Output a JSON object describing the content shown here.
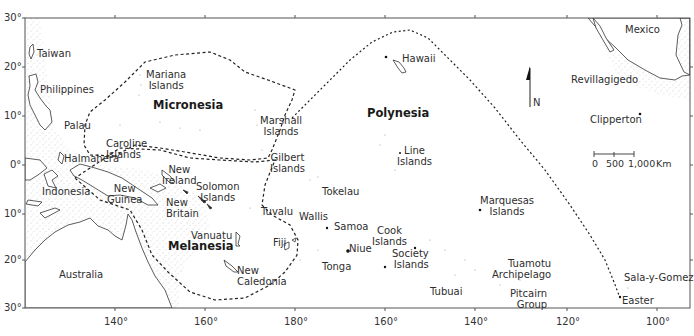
{
  "map": {
    "title": "Pacific Islands: Micronesia, Melanesia, Polynesia",
    "regions": [
      {
        "name": "Micronesia",
        "x": 153,
        "y": 98
      },
      {
        "name": "Polynesia",
        "x": 367,
        "y": 106
      },
      {
        "name": "Melanesia",
        "x": 168,
        "y": 240
      }
    ],
    "labels": [
      {
        "id": "mexico",
        "text": "Mexico",
        "x": 625,
        "y": 24
      },
      {
        "id": "taiwan",
        "text": "Taiwan",
        "x": 37,
        "y": 48
      },
      {
        "id": "hawaii",
        "text": "Hawaii",
        "x": 402,
        "y": 53
      },
      {
        "id": "philippines",
        "text": "Philippines",
        "x": 40,
        "y": 84
      },
      {
        "id": "revillagigedo",
        "text": "Revillagigedo",
        "x": 571,
        "y": 74
      },
      {
        "id": "mariana",
        "text": "Mariana\nIslands",
        "x": 146,
        "y": 69
      },
      {
        "id": "palau",
        "text": "Palau",
        "x": 64,
        "y": 120
      },
      {
        "id": "marshall",
        "text": "Marshall\nIslands",
        "x": 260,
        "y": 115
      },
      {
        "id": "clipperton",
        "text": "Clipperton",
        "x": 590,
        "y": 114
      },
      {
        "id": "caroline",
        "text": "Caroline\nIslands",
        "x": 106,
        "y": 138
      },
      {
        "id": "line",
        "text": "Line\nIslands",
        "x": 397,
        "y": 145
      },
      {
        "id": "gilbert",
        "text": "Gilbert\nIslands",
        "x": 270,
        "y": 152
      },
      {
        "id": "halmahera",
        "text": "Halmahera",
        "x": 64,
        "y": 153
      },
      {
        "id": "new-ireland",
        "text": "New\nIreland",
        "x": 162,
        "y": 164
      },
      {
        "id": "indonesia",
        "text": "Indonesia",
        "x": 42,
        "y": 186
      },
      {
        "id": "new-guinea",
        "text": "New\nGuinea",
        "x": 107,
        "y": 183
      },
      {
        "id": "solomon",
        "text": "Solomon\nIslands",
        "x": 196,
        "y": 181
      },
      {
        "id": "tokelau",
        "text": "Tokelau",
        "x": 322,
        "y": 186
      },
      {
        "id": "marquesas",
        "text": "Marquesas\nIslands",
        "x": 480,
        "y": 195
      },
      {
        "id": "new-britain",
        "text": "New\nBritain",
        "x": 166,
        "y": 197
      },
      {
        "id": "tuvalu",
        "text": "Tuvalu",
        "x": 261,
        "y": 206
      },
      {
        "id": "wallis",
        "text": "Wallis",
        "x": 299,
        "y": 211
      },
      {
        "id": "samoa",
        "text": "Samoa",
        "x": 334,
        "y": 221
      },
      {
        "id": "vanuatu",
        "text": "Vanuatu",
        "x": 191,
        "y": 230
      },
      {
        "id": "cook",
        "text": "Cook\nIslands",
        "x": 372,
        "y": 225
      },
      {
        "id": "fiji",
        "text": "Fiji",
        "x": 273,
        "y": 237
      },
      {
        "id": "niue",
        "text": "Niue",
        "x": 349,
        "y": 243
      },
      {
        "id": "society",
        "text": "Society\nIslands",
        "x": 392,
        "y": 248
      },
      {
        "id": "tonga",
        "text": "Tonga",
        "x": 322,
        "y": 261
      },
      {
        "id": "new-caledonia",
        "text": "New\nCaledonia",
        "x": 237,
        "y": 265
      },
      {
        "id": "tuamotu",
        "text": "Tuamotu\nArchipelago",
        "x": 492,
        "y": 258
      },
      {
        "id": "australia",
        "text": "Australia",
        "x": 59,
        "y": 269
      },
      {
        "id": "sala-y-gomez",
        "text": "Sala-y-Gomez",
        "x": 624,
        "y": 272
      },
      {
        "id": "tubuai",
        "text": "Tubuai",
        "x": 430,
        "y": 286
      },
      {
        "id": "pitcairn",
        "text": "Pitcairn\nGroup",
        "x": 510,
        "y": 288
      },
      {
        "id": "easter",
        "text": "Easter",
        "x": 622,
        "y": 295
      }
    ],
    "north_arrow": {
      "label": "N",
      "x": 528,
      "y": 70
    },
    "scale_bar": {
      "ticks": [
        "0",
        "500",
        "1,000"
      ],
      "unit": "Km",
      "x": 594,
      "y": 153
    },
    "axes": {
      "latitude_ticks": [
        "30°",
        "20°",
        "10°",
        "0°",
        "10°",
        "20°",
        "30°"
      ],
      "longitude_ticks": [
        "140°",
        "160°",
        "180°",
        "160°",
        "140°",
        "120°",
        "100°"
      ]
    },
    "colors": {
      "frame": "#555555",
      "coast": "#333333",
      "stipple": "#9a9a9a",
      "boundary": "#222222",
      "background": "#ffffff"
    }
  }
}
